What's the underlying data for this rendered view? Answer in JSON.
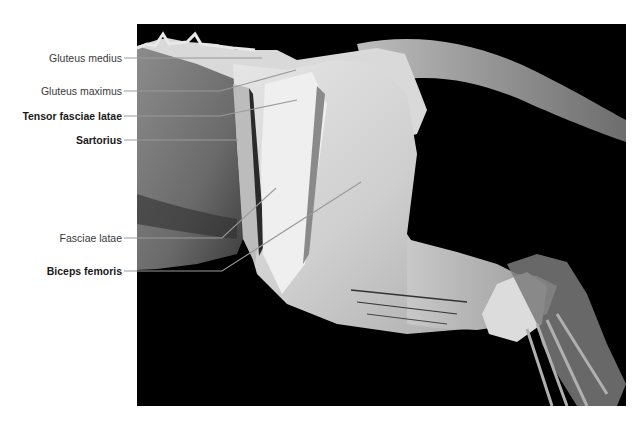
{
  "figure": {
    "background": "#000000",
    "labels": [
      {
        "id": "gluteus-medius",
        "text": "Gluteus medius",
        "bold": false
      },
      {
        "id": "gluteus-maximus",
        "text": "Gluteus maximus",
        "bold": false
      },
      {
        "id": "tensor-fasciae-latae",
        "text": "Tensor fasciae latae",
        "bold": true
      },
      {
        "id": "sartorius",
        "text": "Sartorius",
        "bold": true
      },
      {
        "id": "fasciae-latae",
        "text": "Fasciae latae",
        "bold": false
      },
      {
        "id": "biceps-femoris",
        "text": "Biceps femoris",
        "bold": true
      }
    ],
    "leader_color": "#9a9a9a"
  }
}
